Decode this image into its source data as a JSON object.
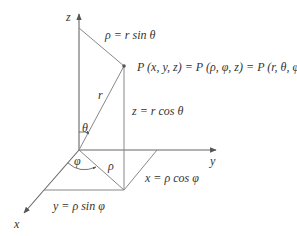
{
  "figure": {
    "type": "coordinate-system-diagram",
    "axes": {
      "z_label": "z",
      "y_label": "y",
      "x_label": "x"
    },
    "labels": {
      "rho_top": "ρ = r sin θ",
      "point": "P (x, y, z) = P (ρ, φ, z) = P (r, θ, φ)",
      "z_eq": "z = r cos θ",
      "r": "r",
      "theta": "θ",
      "phi": "φ",
      "rho": "ρ",
      "x_eq": "x = ρ cos φ",
      "y_eq": "y = ρ sin φ"
    },
    "colors": {
      "line": "#7a7a7a",
      "axis": "#555555",
      "text": "#333333",
      "background": "#ffffff"
    }
  }
}
